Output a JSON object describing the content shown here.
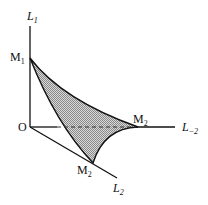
{
  "diagram": {
    "axes": {
      "vertical": "L",
      "vertical_sub": "1",
      "diagonal": "L",
      "diagonal_sub": "2",
      "horizontal": "L",
      "horizontal_sub": "−2"
    },
    "points": {
      "origin": "O",
      "m1": "M",
      "m1_sub": "1",
      "m2_right": "M",
      "m2_right_sub": "2",
      "m2_bottom": "M",
      "m2_bottom_sub": "2"
    },
    "colors": {
      "line": "#111111",
      "fill": "#a9a9a9"
    }
  }
}
